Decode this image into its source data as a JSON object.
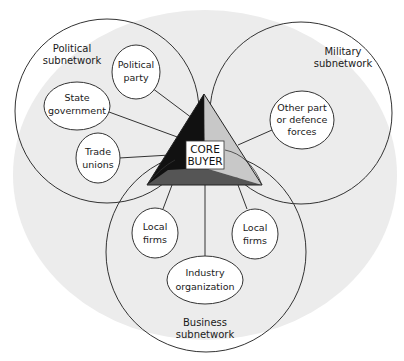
{
  "diagram": {
    "core": {
      "line1": "CORE",
      "line2": "BUYER"
    },
    "subnetworks": {
      "political": {
        "line1": "Political",
        "line2": "subnetwork"
      },
      "military": {
        "line1": "Military",
        "line2": "subnetwork"
      },
      "business": {
        "line1": "Business",
        "line2": "subnetwork"
      }
    },
    "nodes": {
      "political_party": {
        "line1": "Political",
        "line2": "party"
      },
      "state_government": {
        "line1": "State",
        "line2": "government"
      },
      "trade_unions": {
        "line1": "Trade",
        "line2": "unions"
      },
      "defence_forces": {
        "line1": "Other part",
        "line2": "or defence",
        "line3": "forces"
      },
      "local_firms_left": {
        "line1": "Local",
        "line2": "firms"
      },
      "local_firms_right": {
        "line1": "Local",
        "line2": "firms"
      },
      "industry_org": {
        "line1": "Industry",
        "line2": "organization"
      }
    },
    "colors": {
      "background_blob": "#ececec",
      "triangle_left": "#111111",
      "triangle_right": "#c8c8c8",
      "triangle_bottom": "#555555"
    }
  }
}
